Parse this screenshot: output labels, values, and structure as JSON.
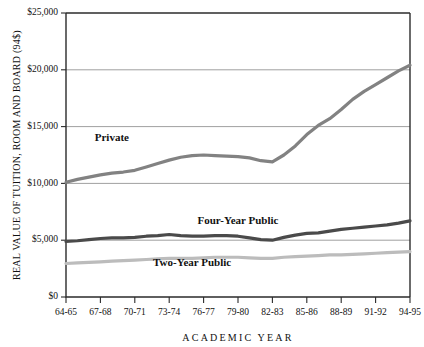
{
  "chart_data": {
    "type": "line",
    "title": "",
    "xlabel": "ACADEMIC YEAR",
    "ylabel": "REAL VALUE OF TUITION, ROOM AND BOARD (94$)",
    "ylim": [
      0,
      25000
    ],
    "ytick_labels": [
      "$25,000",
      "$20,000",
      "$15,000",
      "$10,000",
      "$5,000",
      "$0"
    ],
    "ytick_values": [
      25000,
      20000,
      15000,
      10000,
      5000,
      0
    ],
    "grid": true,
    "legend_position": "inline-annotations",
    "categories": [
      "64-65",
      "65-66",
      "66-67",
      "67-68",
      "68-69",
      "69-70",
      "70-71",
      "71-72",
      "72-73",
      "73-74",
      "74-75",
      "75-76",
      "76-77",
      "77-78",
      "78-79",
      "79-80",
      "80-81",
      "81-82",
      "82-83",
      "83-84",
      "84-85",
      "85-86",
      "86-87",
      "87-88",
      "88-89",
      "89-90",
      "90-91",
      "91-92",
      "92-93",
      "93-94",
      "94-95"
    ],
    "xtick_labels": [
      "64-65",
      "67-68",
      "70-71",
      "73-74",
      "76-77",
      "79-80",
      "82-83",
      "85-86",
      "88-89",
      "91-92",
      "94-95"
    ],
    "series": [
      {
        "name": "Private",
        "color": "#828282",
        "label_x": "68-69",
        "label_y": 13700,
        "values": [
          10100,
          10350,
          10550,
          10750,
          10900,
          11000,
          11150,
          11450,
          11750,
          12050,
          12300,
          12450,
          12500,
          12450,
          12400,
          12350,
          12250,
          12000,
          11900,
          12500,
          13300,
          14300,
          15100,
          15700,
          16500,
          17400,
          18100,
          18700,
          19300,
          19900,
          20400
        ]
      },
      {
        "name": "Four-Year Public",
        "color": "#4a4a4a",
        "label_x": "79-80",
        "label_y": 6400,
        "values": [
          4900,
          4950,
          5050,
          5150,
          5200,
          5200,
          5250,
          5350,
          5400,
          5500,
          5400,
          5350,
          5350,
          5400,
          5400,
          5350,
          5200,
          5050,
          5000,
          5250,
          5450,
          5600,
          5650,
          5800,
          5950,
          6050,
          6150,
          6250,
          6350,
          6500,
          6700
        ]
      },
      {
        "name": "Two-Year Public",
        "color": "#bcbcbc",
        "label_x": "75-76",
        "label_y": 2700,
        "values": [
          2950,
          3000,
          3050,
          3100,
          3150,
          3200,
          3250,
          3300,
          3350,
          3400,
          3400,
          3400,
          3450,
          3500,
          3500,
          3500,
          3450,
          3400,
          3400,
          3500,
          3550,
          3600,
          3650,
          3700,
          3700,
          3750,
          3800,
          3850,
          3900,
          3950,
          4000
        ]
      }
    ]
  }
}
